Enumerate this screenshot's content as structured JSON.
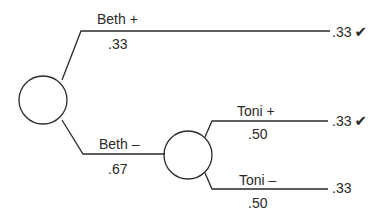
{
  "tree": {
    "root": {
      "branches": [
        {
          "label": "Beth +",
          "probability": ".33",
          "outcome": ".33",
          "check": "✔"
        },
        {
          "label": "Beth –",
          "probability": ".67"
        }
      ]
    },
    "sub_node": {
      "branches": [
        {
          "label": "Toni +",
          "probability": ".50",
          "outcome": ".33",
          "check": "✔"
        },
        {
          "label": "Toni –",
          "probability": ".50",
          "outcome": ".33"
        }
      ]
    }
  }
}
